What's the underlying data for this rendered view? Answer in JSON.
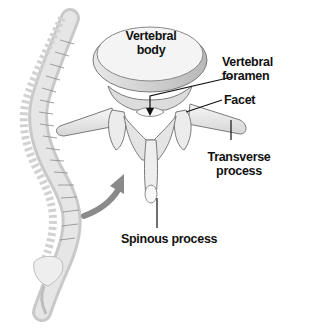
{
  "diagram": {
    "labels": {
      "vertebral_body": [
        "Vertebral",
        "body"
      ],
      "vertebral_foramen": [
        "Vertebral",
        "foramen"
      ],
      "facet": "Facet",
      "transverse_process": [
        "Transverse",
        "process"
      ],
      "spinous_process": "Spinous process"
    },
    "illustrations": [
      "spine-side-view",
      "vertebra-superior-oblique-view",
      "curved-arrow"
    ],
    "colors": {
      "bone_fill": "#eeeeee",
      "bone_shade": "#c8c8c8",
      "outline": "#777777",
      "arrow": "#8a8a8a",
      "leader_line": "#111111",
      "text": "#111111"
    }
  }
}
